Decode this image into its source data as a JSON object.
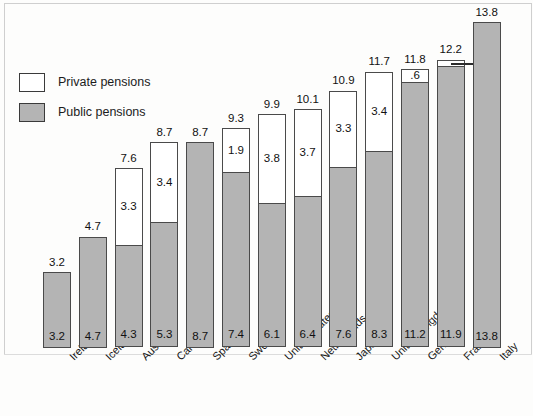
{
  "legend": {
    "items": [
      {
        "key": "private",
        "label": "Private pensions",
        "color": "#ffffff"
      },
      {
        "key": "public",
        "label": "Public pensions",
        "color": "#b4b4b4"
      }
    ]
  },
  "chart_data": {
    "type": "bar",
    "stacked": true,
    "title": "",
    "subtitle": "",
    "xlabel": "",
    "ylabel": "",
    "grid": false,
    "legend_position": "top-left",
    "ylim": [
      0,
      13.8
    ],
    "categories": [
      "Ireland",
      "Iceland",
      "Australia",
      "Canada",
      "Spain",
      "Sweden",
      "United States",
      "Netherlands",
      "Japan",
      "United Kingdom",
      "Germany",
      "France",
      "Italy"
    ],
    "series": [
      {
        "name": "Public pensions",
        "color": "#b4b4b4",
        "values": [
          3.2,
          4.7,
          4.3,
          5.3,
          8.7,
          7.4,
          6.1,
          6.4,
          7.6,
          8.3,
          11.2,
          11.9,
          13.8
        ],
        "labels": [
          "3.2",
          "4.7",
          "4.3",
          "5.3",
          "8.7",
          "7.4",
          "6.1",
          "6.4",
          "7.6",
          "8.3",
          "11.2",
          "11.9",
          "13.8"
        ]
      },
      {
        "name": "Private pensions",
        "color": "#ffffff",
        "values": [
          0,
          0,
          3.3,
          3.4,
          0,
          1.9,
          3.8,
          3.7,
          3.3,
          3.4,
          0.6,
          0.3,
          0
        ],
        "labels": [
          "",
          "",
          "3.3",
          "3.4",
          "",
          "1.9",
          "3.8",
          "3.7",
          "3.3",
          "3.4",
          ".6",
          ".3",
          ""
        ]
      }
    ],
    "totals": [
      3.2,
      4.7,
      7.6,
      8.7,
      8.7,
      9.3,
      9.9,
      10.1,
      10.9,
      11.7,
      11.8,
      12.2,
      13.8
    ],
    "total_labels": [
      "3.2",
      "4.7",
      "7.6",
      "8.7",
      "8.7",
      "9.3",
      "9.9",
      "10.1",
      "10.9",
      "11.7",
      "11.8",
      "12.2",
      "13.8"
    ],
    "callouts": [
      {
        "category": "France",
        "series": "Private pensions",
        "label": ".3"
      }
    ]
  }
}
